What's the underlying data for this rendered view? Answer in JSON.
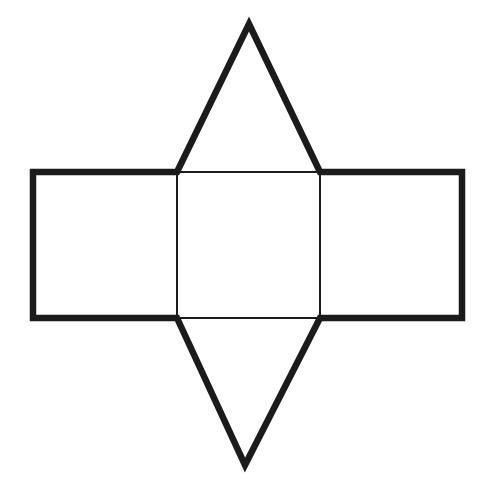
{
  "page": {
    "background_color": "#ffffff"
  },
  "figure": {
    "canvas": {
      "width": 482,
      "height": 491
    },
    "stroke_color": "#1b1b1b",
    "fill_color": "none",
    "outer_boundary": {
      "shape": "polygon",
      "stroke_width": 6.5,
      "points": "249,24 320,172 462,172 462,318 320,318 245,465 177,318 33,318 33,172 177,172"
    },
    "center_square": {
      "shape": "rect",
      "stroke_width": 2,
      "x": 177,
      "y": 172,
      "width": 143,
      "height": 146
    },
    "parts": [
      {
        "name": "top-triangle",
        "role": "triangular face (top flap)"
      },
      {
        "name": "left-square",
        "role": "lateral square face"
      },
      {
        "name": "center-square",
        "role": "lateral square face"
      },
      {
        "name": "right-square",
        "role": "lateral square face"
      },
      {
        "name": "bottom-triangle",
        "role": "triangular face (bottom flap)"
      }
    ]
  }
}
